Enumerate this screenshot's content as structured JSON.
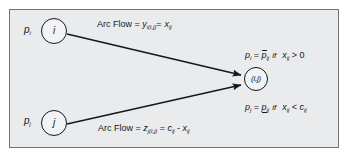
{
  "figure": {
    "type": "network-flow-diagram",
    "background_color": "#ffffff",
    "panel_color": "#e9ebed",
    "panel_border_color": "#6f7478",
    "ink_color": "#14181c"
  },
  "nodes": [
    {
      "id": "node-i",
      "inner_label": "i",
      "outer_label": "p",
      "outer_sub": "i",
      "position": "top-left"
    },
    {
      "id": "node-j",
      "inner_label": "j",
      "outer_label": "p",
      "outer_sub": "j",
      "position": "bottom-left"
    },
    {
      "id": "node-ij",
      "inner_label": "(i,j)",
      "position": "right-center"
    }
  ],
  "edges": [
    {
      "id": "edge-i-to-ij",
      "from": "node-i",
      "to": "node-ij",
      "arrowhead": true,
      "label": {
        "prefix": "Arc Flow = ",
        "term1_base": "y",
        "term1_sub": "i(i,j)",
        "operator": " = ",
        "term2_base": "x",
        "term2_sub": "ij"
      }
    },
    {
      "id": "edge-j-to-ij",
      "from": "node-j",
      "to": "node-ij",
      "arrowhead": true,
      "label": {
        "prefix": "Arc Flow = ",
        "term1_base": "z",
        "term1_sub": "j(i,j)",
        "operator": " = ",
        "term2_base": "c",
        "term2_sub": "ij",
        "operator2": " - ",
        "term3_base": "x",
        "term3_sub": "ij"
      }
    }
  ],
  "conditions": [
    {
      "id": "condition-upper",
      "lhs_base": "p",
      "lhs_sub": "i",
      "equals": "=",
      "rhs_base": "p",
      "rhs_sub": "ij",
      "rhs_decoration": "overbar",
      "keyword": "if",
      "test_lhs_base": "x",
      "test_lhs_sub": "ij",
      "test_operator": ">",
      "test_rhs_base": "0",
      "test_rhs_sub": ""
    },
    {
      "id": "condition-lower",
      "lhs_base": "p",
      "lhs_sub": "j",
      "equals": "=",
      "rhs_base": "p",
      "rhs_sub": "ij",
      "rhs_decoration": "underbar",
      "keyword": "if",
      "test_lhs_base": "x",
      "test_lhs_sub": "ij",
      "test_operator": "<",
      "test_rhs_base": "c",
      "test_rhs_sub": "ij"
    }
  ]
}
